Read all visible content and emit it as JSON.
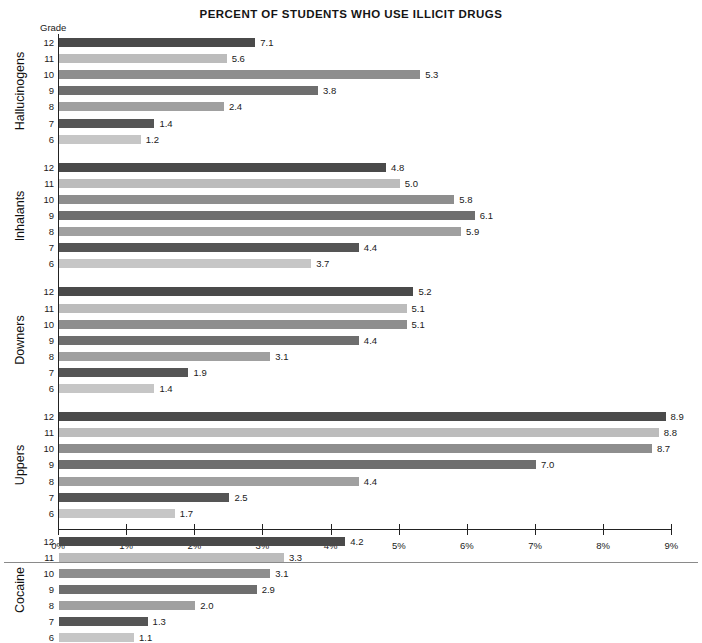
{
  "chart_data": {
    "type": "bar",
    "orientation": "horizontal",
    "title": "Percent Of Students Who Use Illicit Drugs",
    "xlabel": "",
    "ylabel": "Grade",
    "grade_axis_header": "Grade",
    "xlim": [
      0,
      9
    ],
    "xticks": [
      0,
      1,
      2,
      3,
      4,
      5,
      6,
      7,
      8,
      9
    ],
    "xtick_labels": [
      "0%",
      "1%",
      "2%",
      "3%",
      "4%",
      "5%",
      "6%",
      "7%",
      "8%",
      "9%"
    ],
    "grid": false,
    "legend": "none",
    "categories": [
      "12",
      "11",
      "10",
      "9",
      "8",
      "7",
      "6"
    ],
    "groups": [
      {
        "name": "Hallucinogens",
        "rows": [
          {
            "grade": "12",
            "value": 7.1,
            "label": "7.1",
            "bar_pct": 2.88,
            "shade": "s0"
          },
          {
            "grade": "11",
            "value": 5.6,
            "label": "5.6",
            "bar_pct": 2.46,
            "shade": "s1"
          },
          {
            "grade": "10",
            "value": 5.3,
            "label": "5.3",
            "bar_pct": 5.3,
            "shade": "s2"
          },
          {
            "grade": "9",
            "value": 3.8,
            "label": "3.8",
            "bar_pct": 3.8,
            "shade": "s3"
          },
          {
            "grade": "8",
            "value": 2.4,
            "label": "2.4",
            "bar_pct": 2.42,
            "shade": "s4"
          },
          {
            "grade": "7",
            "value": 1.4,
            "label": "1.4",
            "bar_pct": 1.4,
            "shade": "s5"
          },
          {
            "grade": "6",
            "value": 1.2,
            "label": "1.2",
            "bar_pct": 1.2,
            "shade": "s6"
          }
        ]
      },
      {
        "name": "Inhalants",
        "rows": [
          {
            "grade": "12",
            "value": 4.8,
            "label": "4.8",
            "bar_pct": 4.8,
            "shade": "s0"
          },
          {
            "grade": "11",
            "value": 5.0,
            "label": "5.0",
            "bar_pct": 5.0,
            "shade": "s1"
          },
          {
            "grade": "10",
            "value": 5.8,
            "label": "5.8",
            "bar_pct": 5.8,
            "shade": "s2"
          },
          {
            "grade": "9",
            "value": 6.1,
            "label": "6.1",
            "bar_pct": 6.1,
            "shade": "s3"
          },
          {
            "grade": "8",
            "value": 5.9,
            "label": "5.9",
            "bar_pct": 5.9,
            "shade": "s4"
          },
          {
            "grade": "7",
            "value": 4.4,
            "label": "4.4",
            "bar_pct": 4.4,
            "shade": "s5"
          },
          {
            "grade": "6",
            "value": 3.7,
            "label": "3.7",
            "bar_pct": 3.7,
            "shade": "s6"
          }
        ]
      },
      {
        "name": "Downers",
        "rows": [
          {
            "grade": "12",
            "value": 5.2,
            "label": "5.2",
            "bar_pct": 5.2,
            "shade": "s0"
          },
          {
            "grade": "11",
            "value": 5.1,
            "label": "5.1",
            "bar_pct": 5.1,
            "shade": "s1"
          },
          {
            "grade": "10",
            "value": 5.1,
            "label": "5.1",
            "bar_pct": 5.1,
            "shade": "s2"
          },
          {
            "grade": "9",
            "value": 4.4,
            "label": "4.4",
            "bar_pct": 4.4,
            "shade": "s3"
          },
          {
            "grade": "8",
            "value": 3.1,
            "label": "3.1",
            "bar_pct": 3.1,
            "shade": "s4"
          },
          {
            "grade": "7",
            "value": 1.9,
            "label": "1.9",
            "bar_pct": 1.9,
            "shade": "s5"
          },
          {
            "grade": "6",
            "value": 1.4,
            "label": "1.4",
            "bar_pct": 1.4,
            "shade": "s6"
          }
        ]
      },
      {
        "name": "Uppers",
        "rows": [
          {
            "grade": "12",
            "value": 8.9,
            "label": "8.9",
            "bar_pct": 8.9,
            "shade": "s0"
          },
          {
            "grade": "11",
            "value": 8.8,
            "label": "8.8",
            "bar_pct": 8.8,
            "shade": "s1"
          },
          {
            "grade": "10",
            "value": 8.7,
            "label": "8.7",
            "bar_pct": 8.7,
            "shade": "s2"
          },
          {
            "grade": "9",
            "value": 7.0,
            "label": "7.0",
            "bar_pct": 7.0,
            "shade": "s3"
          },
          {
            "grade": "8",
            "value": 4.4,
            "label": "4.4",
            "bar_pct": 4.4,
            "shade": "s4"
          },
          {
            "grade": "7",
            "value": 2.5,
            "label": "2.5",
            "bar_pct": 2.5,
            "shade": "s5"
          },
          {
            "grade": "6",
            "value": 1.7,
            "label": "1.7",
            "bar_pct": 1.7,
            "shade": "s6"
          }
        ]
      },
      {
        "name": "Cocaine",
        "rows": [
          {
            "grade": "12",
            "value": 4.2,
            "label": "4.2",
            "bar_pct": 4.2,
            "shade": "s0"
          },
          {
            "grade": "11",
            "value": 3.3,
            "label": "3.3",
            "bar_pct": 3.3,
            "shade": "s1"
          },
          {
            "grade": "10",
            "value": 3.1,
            "label": "3.1",
            "bar_pct": 3.1,
            "shade": "s2"
          },
          {
            "grade": "9",
            "value": 2.9,
            "label": "2.9",
            "bar_pct": 2.9,
            "shade": "s3"
          },
          {
            "grade": "8",
            "value": 2.0,
            "label": "2.0",
            "bar_pct": 2.0,
            "shade": "s4"
          },
          {
            "grade": "7",
            "value": 1.3,
            "label": "1.3",
            "bar_pct": 1.3,
            "shade": "s5"
          },
          {
            "grade": "6",
            "value": 1.1,
            "label": "1.1",
            "bar_pct": 1.1,
            "shade": "s6"
          }
        ]
      }
    ]
  }
}
